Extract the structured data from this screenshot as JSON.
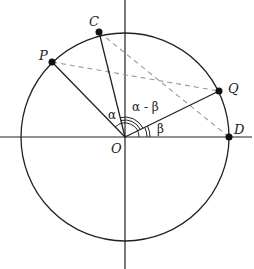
{
  "diagram": {
    "type": "unit-circle-angle-difference",
    "origin": {
      "label": "O",
      "x": 125,
      "y": 137
    },
    "radius": 104,
    "points": [
      {
        "id": "P",
        "label": "P",
        "x": 52,
        "y": 62,
        "lx": 38,
        "ly": 58
      },
      {
        "id": "C",
        "label": "C",
        "x": 99,
        "y": 32,
        "lx": 90,
        "ly": 25
      },
      {
        "id": "Q",
        "label": "Q",
        "x": 219,
        "y": 91,
        "lx": 230,
        "ly": 90
      },
      {
        "id": "D",
        "label": "D",
        "x": 229,
        "y": 137,
        "lx": 235,
        "ly": 131
      }
    ],
    "angles": {
      "alpha": "α",
      "alpha_minus_beta": "α - β",
      "beta": "β"
    },
    "colors": {
      "stroke": "#222222",
      "dashed": "#999999",
      "point": "#111111"
    }
  }
}
